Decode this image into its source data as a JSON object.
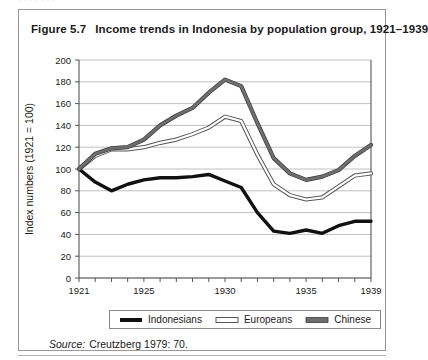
{
  "page": {
    "bleed_text": "·  ·   ·        ·                    ·            ·                 ·"
  },
  "figure": {
    "number": "Figure 5.7",
    "title": "Income trends in Indonesia by population group, 1921–1939",
    "source_word": "Source:",
    "source_text": "Creutzberg 1979: 70."
  },
  "colors": {
    "indonesians": "#111111",
    "europeans": "#ffffff",
    "europeans_outline": "#555555",
    "chinese": "#6e6e6e",
    "chinese_outline": "#3d3d3d",
    "grid": "#b9b9b9",
    "axis": "#555555",
    "frame": "#999999",
    "text": "#1a1a1a"
  },
  "chart_data": {
    "type": "line",
    "title": "Income trends in Indonesia by population group, 1921–1939",
    "xlabel": "",
    "ylabel": "Index numbers (1921 = 100)",
    "xlim": [
      1921,
      1939
    ],
    "ylim": [
      0,
      200
    ],
    "ytick_step": 20,
    "yticks": [
      0,
      20,
      40,
      60,
      80,
      100,
      120,
      140,
      160,
      180,
      200
    ],
    "ytick_labels": [
      "0",
      "20",
      "40",
      "60",
      "80",
      "100",
      "120",
      "140",
      "160",
      "180",
      "200"
    ],
    "x": [
      1921,
      1922,
      1923,
      1924,
      1925,
      1926,
      1927,
      1928,
      1929,
      1930,
      1931,
      1932,
      1933,
      1934,
      1935,
      1936,
      1937,
      1938,
      1939
    ],
    "xticks": [
      1921,
      1922,
      1923,
      1924,
      1925,
      1926,
      1927,
      1928,
      1929,
      1930,
      1931,
      1932,
      1933,
      1934,
      1935,
      1936,
      1937,
      1938,
      1939
    ],
    "xtick_labels_shown": [
      "1921",
      "1925",
      "1930",
      "1935",
      "1939"
    ],
    "xtick_label_years": [
      1921,
      1925,
      1930,
      1935,
      1939
    ],
    "grid": "horizontal",
    "legend_position": "below-axis",
    "series": [
      {
        "name": "Indonesians",
        "style": "thick-black",
        "values": [
          100,
          88,
          80,
          86,
          90,
          92,
          92,
          93,
          95,
          89,
          83,
          60,
          43,
          41,
          44,
          41,
          48,
          52,
          52
        ]
      },
      {
        "name": "Europeans",
        "style": "hollow-white",
        "values": [
          100,
          112,
          118,
          118,
          120,
          124,
          127,
          132,
          138,
          148,
          144,
          113,
          86,
          76,
          72,
          74,
          84,
          94,
          96
        ]
      },
      {
        "name": "Chinese",
        "style": "gray",
        "values": [
          100,
          114,
          119,
          120,
          127,
          140,
          149,
          156,
          170,
          182,
          176,
          142,
          110,
          96,
          90,
          93,
          99,
          112,
          122
        ]
      }
    ]
  }
}
